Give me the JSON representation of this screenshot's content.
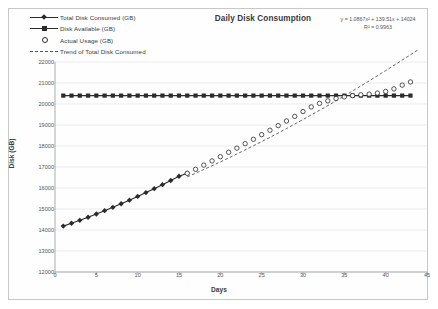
{
  "chart_data": {
    "type": "line",
    "title": "Daily Disk Consumption",
    "xlabel": "Days",
    "ylabel": "Disk (GB)",
    "xlim": [
      0,
      45
    ],
    "ylim": [
      12000,
      22000
    ],
    "xticks": [
      0,
      5,
      10,
      15,
      20,
      25,
      30,
      35,
      40,
      45
    ],
    "yticks": [
      12000,
      13000,
      14000,
      15000,
      16000,
      17000,
      18000,
      19000,
      20000,
      21000,
      22000
    ],
    "grid": "horizontal",
    "legend_position": "top-left",
    "annotations": {
      "equation": "y = 1.0867x² + 139.51x + 14024",
      "r_squared": "R² = 0.9963"
    },
    "series": [
      {
        "name": "Total Disk Consumed (GB)",
        "marker": "diamond",
        "style": "solid",
        "color": "#2b2b2b",
        "x": [
          1,
          2,
          3,
          4,
          5,
          6,
          7,
          8,
          9,
          10,
          11,
          12,
          13,
          14,
          15,
          16
        ],
        "values": [
          14185,
          14320,
          14460,
          14610,
          14760,
          14920,
          15080,
          15250,
          15420,
          15600,
          15780,
          15970,
          16160,
          16360,
          16560,
          16700
        ]
      },
      {
        "name": "Disk Available (GB)",
        "marker": "square",
        "style": "solid",
        "color": "#2b2b2b",
        "x": [
          1,
          2,
          3,
          4,
          5,
          6,
          7,
          8,
          9,
          10,
          11,
          12,
          13,
          14,
          15,
          16,
          17,
          18,
          19,
          20,
          21,
          22,
          23,
          24,
          25,
          26,
          27,
          28,
          29,
          30,
          31,
          32,
          33,
          34,
          35,
          36,
          37,
          38,
          39,
          40,
          41,
          42,
          43
        ],
        "values": [
          20400,
          20400,
          20400,
          20400,
          20400,
          20400,
          20400,
          20400,
          20400,
          20400,
          20400,
          20400,
          20400,
          20400,
          20400,
          20400,
          20400,
          20400,
          20400,
          20400,
          20400,
          20400,
          20400,
          20400,
          20400,
          20400,
          20400,
          20400,
          20400,
          20400,
          20400,
          20400,
          20400,
          20400,
          20400,
          20400,
          20400,
          20400,
          20400,
          20400,
          20400,
          20400,
          20400
        ]
      },
      {
        "name": "Actual Usage (GB)",
        "marker": "open-circle",
        "style": "none",
        "color": "#2b2b2b",
        "x": [
          16,
          17,
          18,
          19,
          20,
          21,
          22,
          23,
          24,
          25,
          26,
          27,
          28,
          29,
          30,
          31,
          32,
          33,
          34,
          35,
          36,
          37,
          38,
          39,
          40,
          41,
          42,
          43
        ],
        "values": [
          16700,
          16890,
          17090,
          17290,
          17490,
          17700,
          17900,
          18110,
          18320,
          18540,
          18750,
          18970,
          19190,
          19410,
          19640,
          19860,
          20030,
          20150,
          20260,
          20340,
          20400,
          20440,
          20470,
          20520,
          20600,
          20720,
          20900,
          21050
        ]
      },
      {
        "name": "Trend of Total Disk Consumed",
        "marker": "none",
        "style": "dashed",
        "color": "#555555",
        "x": [
          16,
          18,
          20,
          22,
          24,
          26,
          28,
          30,
          32,
          34,
          36,
          38,
          40,
          42,
          44
        ],
        "values": [
          16530,
          16880,
          17240,
          17620,
          18010,
          18410,
          18830,
          19260,
          19700,
          20150,
          20620,
          21100,
          21590,
          22090,
          22600
        ]
      }
    ]
  },
  "legend": {
    "items": [
      "Total Disk Consumed (GB)",
      "Disk Available (GB)",
      "Actual Usage (GB)",
      "Trend of Total Disk Consumed"
    ]
  }
}
